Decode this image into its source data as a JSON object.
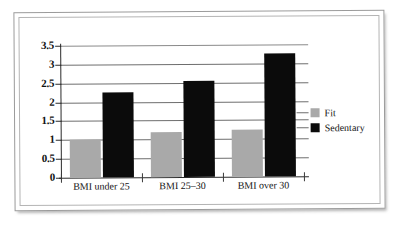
{
  "chart_data": {
    "type": "bar",
    "title": "",
    "subtitle": "",
    "xlabel": "",
    "ylabel": "",
    "categories": [
      "BMI under 25",
      "BMI 25–30",
      "BMI over 30"
    ],
    "series": [
      {
        "name": "Fit",
        "color": "#a9a9a9",
        "values": [
          1.0,
          1.2,
          1.25
        ]
      },
      {
        "name": "Sedentary",
        "color": "#0b0b0b",
        "values": [
          2.25,
          2.55,
          3.25
        ]
      }
    ],
    "ylim": [
      0,
      3.5
    ],
    "ytick_values": [
      0,
      0.5,
      1,
      1.5,
      2,
      2.5,
      3,
      3.5
    ],
    "ytick_labels": [
      "0",
      "0.5",
      "1",
      "1.5",
      "2",
      "2.5",
      "3",
      "3.5"
    ],
    "grid": true,
    "grid_axis": "y",
    "legend_position": "right",
    "annotations": []
  },
  "figure": {
    "background_color": "#ffffff",
    "frame_color": "#9b9b9b",
    "axis_color": "#2b2b2b",
    "gridline_color": "#6e6e6e"
  }
}
